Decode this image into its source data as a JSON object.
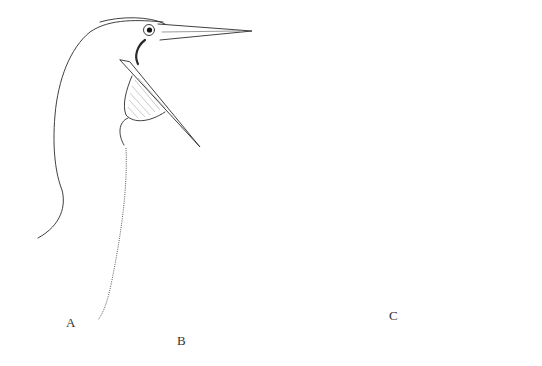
{
  "figure": {
    "panels": [
      {
        "id": "A",
        "label": "A",
        "subject": "bird head with long pointed bill, mouth open, small gular pouch (booby/gannet-like)"
      },
      {
        "id": "B",
        "label": "B",
        "subject": "bird head with hooked bill, mouth open, small gular pouch (cormorant-like)"
      },
      {
        "id": "C",
        "label": "C",
        "subject": "pelican head with very long hooked bill and large distended gular pouch"
      }
    ],
    "inset": {
      "name": "bill-tip-detail",
      "subject": "small ventral view sketch of bill tip / nostril"
    },
    "colors": {
      "ink": "#2a2a2a",
      "background": "#ffffff"
    }
  }
}
